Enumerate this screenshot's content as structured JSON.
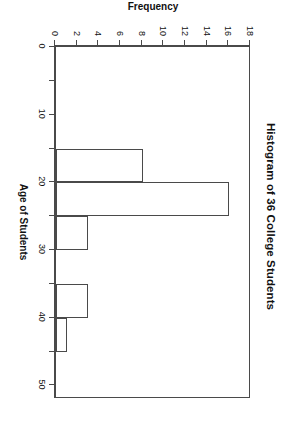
{
  "chart_data": {
    "type": "bar",
    "title": "Histogram of 36 College Students",
    "xlabel": "Age of Students",
    "ylabel": "Frequency",
    "xlim": [
      0,
      52
    ],
    "ylim": [
      0,
      18
    ],
    "grid": false,
    "legend": null,
    "orientation": "rotated-90-clockwise",
    "bin_width": 5,
    "categories": [
      "15-20",
      "20-25",
      "25-30",
      "30-35",
      "35-40",
      "40-45"
    ],
    "bins": [
      {
        "start": 15,
        "end": 20,
        "value": 8
      },
      {
        "start": 20,
        "end": 25,
        "value": 16
      },
      {
        "start": 25,
        "end": 30,
        "value": 3
      },
      {
        "start": 30,
        "end": 35,
        "value": 0
      },
      {
        "start": 35,
        "end": 40,
        "value": 3
      },
      {
        "start": 40,
        "end": 45,
        "value": 1
      }
    ],
    "values": [
      8,
      16,
      3,
      0,
      3,
      1
    ],
    "x_ticks_major": [
      0,
      10,
      20,
      30,
      40,
      50
    ],
    "x_tick_labels": [
      "0",
      "10",
      "20",
      "30",
      "40",
      "50"
    ],
    "x_ticks_minor": [
      5,
      15,
      25,
      35,
      45
    ],
    "y_ticks": [
      0,
      2,
      4,
      6,
      8,
      10,
      12,
      14,
      16,
      18
    ],
    "y_tick_labels": [
      "0",
      "2",
      "4",
      "6",
      "8",
      "10",
      "12",
      "14",
      "16",
      "18"
    ],
    "colors": {
      "bar_fill": "#ffffff",
      "bar_stroke": "#4a4a4a",
      "axis": "#4a4a4a",
      "text": "#111111",
      "background": "#ffffff"
    }
  }
}
